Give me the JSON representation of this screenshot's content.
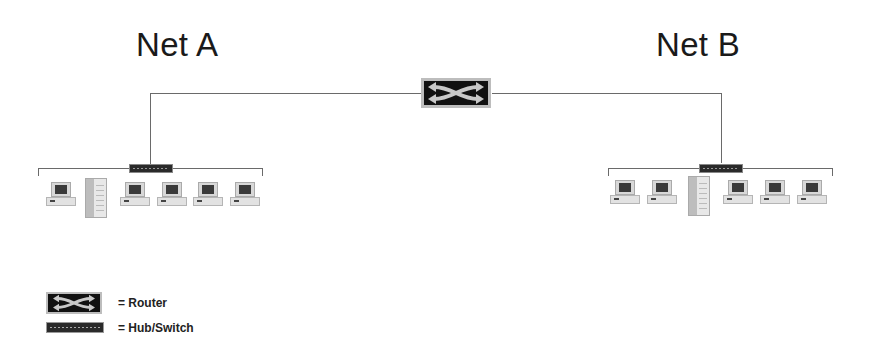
{
  "diagram": {
    "networks": [
      {
        "label": "Net A",
        "devices": [
          "laptop",
          "server",
          "laptop",
          "laptop",
          "laptop",
          "laptop"
        ],
        "connector": "hub-switch"
      },
      {
        "label": "Net B",
        "devices": [
          "laptop",
          "laptop",
          "server",
          "laptop",
          "laptop",
          "laptop"
        ],
        "connector": "hub-switch"
      }
    ],
    "core": {
      "device": "router",
      "connects": [
        "Net A",
        "Net B"
      ]
    }
  },
  "titles": {
    "net_a": "Net A",
    "net_b": "Net B"
  },
  "legend": {
    "router_label": "= Router",
    "hub_label": "= Hub/Switch"
  },
  "colors": {
    "line": "#6a6a6a",
    "device_dark": "#111111",
    "device_frame": "#bdbdbd"
  }
}
